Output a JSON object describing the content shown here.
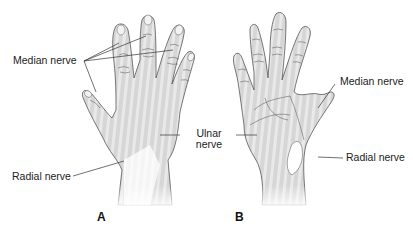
{
  "figure": {
    "type": "anatomical-diagram",
    "panels": [
      {
        "id": "A",
        "label": "A",
        "view": "dorsal hand",
        "callouts": [
          {
            "text": "Median nerve",
            "pointer_count": 4
          },
          {
            "text": "Radial nerve",
            "pointer_count": 1
          }
        ]
      },
      {
        "id": "B",
        "label": "B",
        "view": "palmar hand",
        "callouts": [
          {
            "text": "Median nerve",
            "pointer_count": 1
          },
          {
            "text": "Radial nerve",
            "pointer_count": 1
          }
        ]
      }
    ],
    "shared_callouts": [
      {
        "text_line1": "Ulnar",
        "text_line2": "nerve",
        "points_to": [
          "A",
          "B"
        ]
      }
    ],
    "colors": {
      "outline": "#555555",
      "shading": "#cfcfcf",
      "shading_stripe": "#e2e2e2",
      "label_text": "#222222",
      "background": "#ffffff"
    }
  }
}
